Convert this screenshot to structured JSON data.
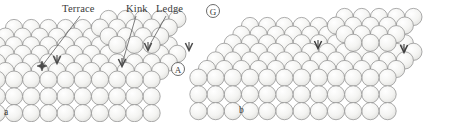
{
  "figure": {
    "kind": "crystal-surface-sphere-model",
    "background_color": "#ffffff",
    "sphere_fill": "#f4f4f2",
    "sphere_stroke": "#8a8a8a",
    "marker_color": "#4a4a4a",
    "leader_color": "#5a5a5a",
    "text_color": "#3a3a3a",
    "annotations": [
      {
        "id": "terrace",
        "label": "Terrace",
        "x": 62,
        "y": 3,
        "leader_from": [
          80,
          16
        ],
        "leader_to": [
          42,
          66
        ]
      },
      {
        "id": "kink",
        "label": "Kink",
        "x": 126,
        "y": 3,
        "leader_from": [
          136,
          16
        ],
        "leader_to": [
          122,
          64
        ]
      },
      {
        "id": "ledge",
        "label": "Ledge",
        "x": 156,
        "y": 3,
        "leader_from": [
          166,
          16
        ],
        "leader_to": [
          148,
          48
        ]
      }
    ],
    "circled_labels": [
      {
        "id": "g-marker",
        "text": "G",
        "x": 206,
        "y": 4
      },
      {
        "id": "a-marker",
        "text": "A",
        "x": 171,
        "y": 62
      }
    ],
    "panels": [
      {
        "id": "panel-a",
        "letter": "a",
        "letter_x": 4,
        "letter_y": 107,
        "origin_x": 14,
        "origin_y": 28
      },
      {
        "id": "panel-b",
        "letter": "b",
        "letter_x": 239,
        "letter_y": 105,
        "origin_x": 250,
        "origin_y": 26
      }
    ],
    "markers": [
      {
        "id": "terrace-arrow",
        "panel": "panel-a",
        "x": 42,
        "y": 66,
        "type": "star"
      },
      {
        "id": "terrace-chevron",
        "panel": "panel-a",
        "x": 57,
        "y": 61,
        "type": "chevron"
      },
      {
        "id": "kink-chevron",
        "panel": "panel-a",
        "x": 122,
        "y": 64,
        "type": "chevron"
      },
      {
        "id": "ledge-chevron",
        "panel": "panel-a",
        "x": 148,
        "y": 48,
        "type": "chevron"
      },
      {
        "id": "step-chevron-right",
        "panel": "panel-a",
        "x": 189,
        "y": 48,
        "type": "chevron"
      },
      {
        "id": "kink-chevron-b",
        "panel": "panel-b",
        "x": 318,
        "y": 46,
        "type": "chevron-dark"
      },
      {
        "id": "ledge-chevron-b",
        "panel": "panel-b",
        "x": 404,
        "y": 50,
        "type": "chevron-dark"
      }
    ],
    "lattice": {
      "sphere_radius": 8.6,
      "row_dx": 17.2,
      "row_dy": 8.6,
      "shear_x": -8.6,
      "description": "close-packed spheres in sheared rows forming a stepped terraced crystal block"
    }
  }
}
